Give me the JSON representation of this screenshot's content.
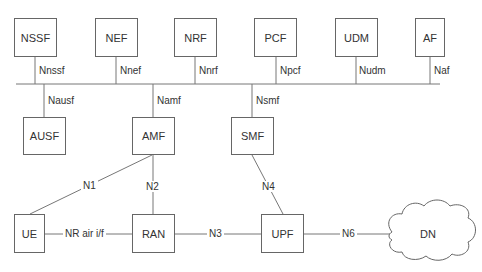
{
  "diagram": {
    "type": "5G service-based architecture",
    "colors": {
      "line": "#777777",
      "box_border": "#666666",
      "text": "#333333",
      "background": "#ffffff"
    },
    "top_nfs": [
      {
        "name": "NSSF",
        "interface": "Nnssf"
      },
      {
        "name": "NEF",
        "interface": "Nnef"
      },
      {
        "name": "NRF",
        "interface": "Nnrf"
      },
      {
        "name": "PCF",
        "interface": "Npcf"
      },
      {
        "name": "UDM",
        "interface": "Nudm"
      },
      {
        "name": "AF",
        "interface": "Naf"
      }
    ],
    "bottom_nfs": [
      {
        "name": "AUSF",
        "interface": "Nausf"
      },
      {
        "name": "AMF",
        "interface": "Namf"
      },
      {
        "name": "SMF",
        "interface": "Nsmf"
      }
    ],
    "user_plane": [
      {
        "name": "UE"
      },
      {
        "name": "RAN"
      },
      {
        "name": "UPF"
      },
      {
        "name": "DN"
      }
    ],
    "links": [
      {
        "label": "N1",
        "from": "UE",
        "to": "AMF"
      },
      {
        "label": "N2",
        "from": "RAN",
        "to": "AMF"
      },
      {
        "label": "N4",
        "from": "UPF",
        "to": "SMF"
      },
      {
        "label": "NR air i/f",
        "from": "UE",
        "to": "RAN"
      },
      {
        "label": "N3",
        "from": "RAN",
        "to": "UPF"
      },
      {
        "label": "N6",
        "from": "UPF",
        "to": "DN"
      }
    ]
  }
}
